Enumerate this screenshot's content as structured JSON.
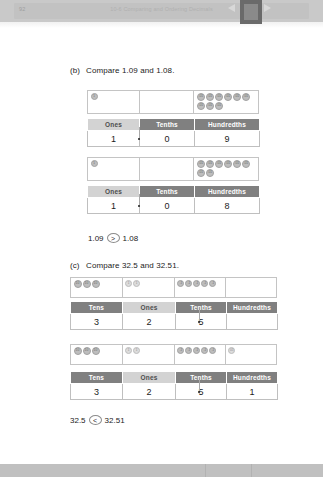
{
  "viewer": {
    "page_number": "92",
    "chapter_title": "10-6 Comparing and Ordering Decimals"
  },
  "problems": [
    {
      "id": "b",
      "label": "(b)",
      "text": "Compare 1.09 and 1.08.",
      "models": [
        {
          "disk_cells": [
            {
              "place": "ones",
              "count": 1,
              "glyph": "1"
            },
            {
              "place": "tenths",
              "count": 0,
              "glyph": "0.1"
            },
            {
              "place": "hundredths",
              "count": 9,
              "glyph": "0.01"
            }
          ],
          "headers": [
            "Ones",
            "Tenths",
            "Hundredths"
          ],
          "values": [
            "1",
            "0",
            "9"
          ]
        },
        {
          "disk_cells": [
            {
              "place": "ones",
              "count": 1,
              "glyph": "1"
            },
            {
              "place": "tenths",
              "count": 0,
              "glyph": "0.1"
            },
            {
              "place": "hundredths",
              "count": 8,
              "glyph": "0.01"
            }
          ],
          "headers": [
            "Ones",
            "Tenths",
            "Hundredths"
          ],
          "values": [
            "1",
            "0",
            "8"
          ]
        }
      ],
      "answer": {
        "left": "1.09",
        "operator": ">",
        "right": "1.08"
      }
    },
    {
      "id": "c",
      "label": "(c)",
      "text": "Compare 32.5 and 32.51.",
      "models": [
        {
          "disk_cells": [
            {
              "place": "tens",
              "count": 3,
              "glyph": "10"
            },
            {
              "place": "ones",
              "count": 2,
              "glyph": "1"
            },
            {
              "place": "tenths",
              "count": 5,
              "glyph": "0.1"
            },
            {
              "place": "hundredths",
              "count": 0,
              "glyph": "0.01"
            }
          ],
          "headers": [
            "Tens",
            "Ones",
            "Tenths",
            "Hundredths"
          ],
          "values": [
            "3",
            "2",
            "5",
            ""
          ]
        },
        {
          "disk_cells": [
            {
              "place": "tens",
              "count": 3,
              "glyph": "10"
            },
            {
              "place": "ones",
              "count": 2,
              "glyph": "1"
            },
            {
              "place": "tenths",
              "count": 5,
              "glyph": "0.1"
            },
            {
              "place": "hundredths",
              "count": 1,
              "glyph": "0.01"
            }
          ],
          "headers": [
            "Tens",
            "Ones",
            "Tenths",
            "Hundredths"
          ],
          "values": [
            "3",
            "2",
            "5",
            "1"
          ]
        }
      ],
      "answer": {
        "left": "32.5",
        "operator": "<",
        "right": "32.51"
      }
    }
  ]
}
